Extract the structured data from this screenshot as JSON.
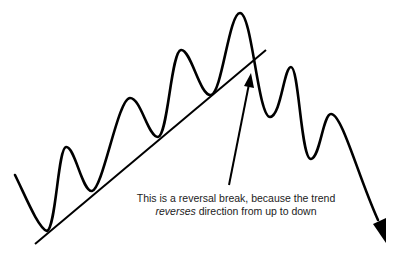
{
  "diagram": {
    "type": "price-trend-reversal",
    "caption": {
      "line1": "This is a reversal break, because the trend",
      "line2_italic": "reverses",
      "line2_rest": " direction from up to down"
    },
    "elements": {
      "price_path": "zigzag price line with higher highs and higher lows, then lower highs and lower lows",
      "trendline": "rising support trendline connecting the higher lows",
      "pointer_arrow": "arrow pointing to where price breaks below the trendline",
      "end_arrow": "downward arrowhead at end of price path"
    },
    "colors": {
      "stroke": "#000000",
      "text": "#222222",
      "background": "#ffffff"
    }
  }
}
